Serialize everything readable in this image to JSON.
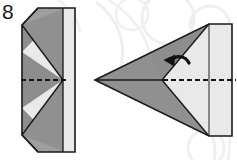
{
  "page": {
    "background_color": "#ffffff",
    "width": 237,
    "height": 160
  },
  "step": {
    "number": "8",
    "label": "step-number"
  },
  "colors": {
    "paper_light": "#e9e9e9",
    "paper_mid": "#9a9a9a",
    "paper_dark": "#888888",
    "paper_shadow": "#7e7e7e",
    "outline": "#1a1a1a",
    "fold_dashed": "#141414",
    "arrow": "#101010",
    "watermark": "#f0eeec",
    "background": "#ffffff"
  },
  "figures": [
    {
      "name": "left-figure",
      "description": "Folded strip seen flat: tall narrow rectangle with chevron/zigzag fold creases and clipped top-left and bottom-left corners",
      "fold_line": "horizontal-dashed-centerline",
      "shading": [
        "dark-left-panel",
        "light-right-panel"
      ]
    },
    {
      "name": "right-figure",
      "description": "Paper airplane shape pointing left with swept wing, vertical tail edge at right",
      "fold_line": "horizontal-dashed-centerline",
      "shading": [
        "dark-wing",
        "light-body"
      ]
    }
  ],
  "annotations": [
    {
      "name": "fold-arrow",
      "type": "curved-arrow",
      "direction": "left",
      "meaning": "fold-back"
    },
    {
      "name": "fold-crease-left",
      "type": "dashed-line",
      "orientation": "horizontal"
    },
    {
      "name": "fold-crease-right",
      "type": "dashed-line",
      "orientation": "horizontal"
    }
  ],
  "watermark": {
    "name": "background-watermark",
    "description": "Faint decorative circular swirl marks behind the diagram"
  }
}
